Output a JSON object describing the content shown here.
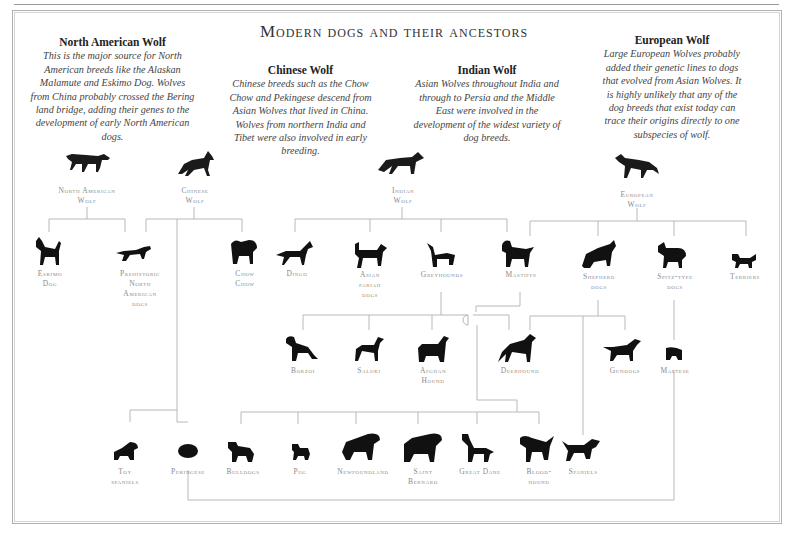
{
  "title": "Modern dogs and their ancestors",
  "wolves": {
    "north_american": {
      "heading": "North American Wolf",
      "text": "This is the major source for North American breeds like the Alaskan Malamute and Eskimo Dog. Wolves from China probably crossed the Bering land bridge, adding their genes to the development of early North American dogs.",
      "label_1": "North American",
      "label_2": "Wolf"
    },
    "chinese": {
      "heading": "Chinese Wolf",
      "text": "Chinese breeds such as the Chow Chow and Pekingese descend from Asian Wolves that lived in China. Wolves from northern India and Tibet were also involved in early breeding.",
      "label_1": "Chinese",
      "label_2": "Wolf"
    },
    "indian": {
      "heading": "Indian Wolf",
      "text": "Asian Wolves throughout India and through to Persia and the Middle East were involved in the development of the widest variety of dog breeds.",
      "label_1": "Indian",
      "label_2": "Wolf"
    },
    "european": {
      "heading": "European Wolf",
      "text": "Large European Wolves probably added their genetic lines to dogs that evolved from Asian Wolves. It is highly unlikely that any of the dog breeds that exist today can trace their origins directly to one subspecies of wolf.",
      "label_1": "European",
      "label_2": "Wolf"
    }
  },
  "row1": {
    "eskimo_dog": [
      "Eskimo",
      "Dog"
    ],
    "prehistoric": [
      "Prehistoric",
      "North",
      "American",
      "dogs"
    ],
    "chow_chow": [
      "Chow",
      "Chow"
    ],
    "dingo": [
      "Dingo"
    ],
    "asian_pariah": [
      "Asian",
      "pariah",
      "dogs"
    ],
    "greyhounds": [
      "Greyhounds"
    ],
    "mastiffs": [
      "Mastiffs"
    ],
    "shepherd": [
      "Shepherd",
      "dogs"
    ],
    "spitz": [
      "Spitz-type",
      "dogs"
    ],
    "terriers": [
      "Terriers"
    ]
  },
  "row2": {
    "borzoi": [
      "Borzoi"
    ],
    "saluki": [
      "Saluki"
    ],
    "afghan": [
      "Afghan",
      "Hound"
    ],
    "deerhound": [
      "Deerhound"
    ],
    "gundogs": [
      "Gundogs"
    ],
    "maltese": [
      "Maltese"
    ]
  },
  "row3": {
    "toy_spaniels": [
      "Toy",
      "spaniels"
    ],
    "pekingese": [
      "Pekingese"
    ],
    "bulldogs": [
      "Bulldogs"
    ],
    "pug": [
      "Pug"
    ],
    "newfoundland": [
      "Newfoundland"
    ],
    "saint_bernard": [
      "Saint",
      "Bernard"
    ],
    "great_dane": [
      "Great Dane"
    ],
    "bloodhound": [
      "Blood-",
      "hound"
    ],
    "spaniels": [
      "Spaniels"
    ]
  },
  "colors": {
    "text": "#333333",
    "label": "#8a8a8a",
    "line": "#b5b5b5",
    "silhouette": "#111111"
  }
}
